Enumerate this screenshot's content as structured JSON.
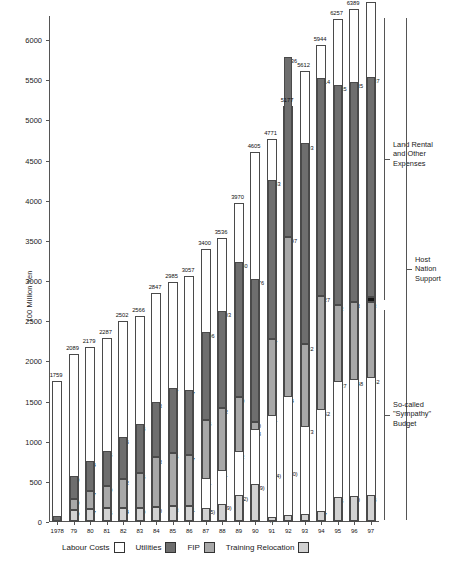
{
  "chart_data": {
    "type": "bar",
    "stacked": true,
    "title": "",
    "xlabel": "",
    "ylabel": "100 Million Yen",
    "ylim": [
      0,
      6300
    ],
    "ytick_values": [
      0,
      500,
      1000,
      1500,
      2000,
      2500,
      3000,
      3500,
      4000,
      4500,
      5000,
      5500,
      6000
    ],
    "ytick_labels": [
      "0",
      "500",
      "1000",
      "1500",
      "2000",
      "2500",
      "3000",
      "3500",
      "4000",
      "4500",
      "5000",
      "5500",
      "6000"
    ],
    "grid": false,
    "legend_position": "bottom",
    "categories": [
      "1978",
      "79",
      "80",
      "81",
      "82",
      "83",
      "84",
      "85",
      "86",
      "87",
      "88",
      "89",
      "90",
      "91",
      "92",
      "93",
      "94",
      "95",
      "96",
      "97"
    ],
    "series": [
      {
        "name": "Labour Costs",
        "color": "#ffffff",
        "values": [
          1759,
          2089,
          2179,
          2287,
          2502,
          2566,
          2847,
          2985,
          3057,
          3400,
          3536,
          3970,
          4605,
          4771,
          5177,
          5612,
          5944,
          6257,
          6389,
          6479
        ]
      },
      {
        "name": "Utilities",
        "color": "#6e6e6e",
        "values": [
          62,
          280,
          374,
          435,
          516,
          608,
          693,
          807,
          817,
          1096,
          1203,
          1680,
          1776,
          1983,
          2236,
          2503,
          2714,
          2735,
          2735,
          2737
        ]
      },
      {
        "name": "FIP",
        "color": "#a8a8a8",
        "values": [
          0,
          140,
          227,
          279,
          362,
          435,
          613,
          654,
          627,
          735,
          792,
          690,
          957,
          1736,
          1997,
          1032,
          1252,
          1427,
          1448,
          1462
        ]
      },
      {
        "name": "Training Relocation",
        "color": "#d2d2d2",
        "values": [
          0,
          140,
          147,
          156,
          164,
          159,
          180,
          193,
          191,
          165,
          209,
          322,
          459,
          47,
          81,
          93,
          127,
          305,
          310,
          318
        ]
      }
    ],
    "bar_totals": [
      1759,
      2089,
      2179,
      2287,
      2502,
      2566,
      2847,
      2985,
      3057,
      3400,
      3536,
      3970,
      4605,
      4771,
      5177,
      5612,
      5944,
      6257,
      6389,
      6479
    ],
    "bars": [
      {
        "year": "1978",
        "total": 1759,
        "segments": [
          {
            "label": "62",
            "value": 62,
            "series": "utilities"
          }
        ]
      },
      {
        "year": "79",
        "total": 2089,
        "segments": [
          {
            "label": "140",
            "value": 140,
            "series": "training"
          },
          {
            "label": "140",
            "value": 140,
            "series": "fip"
          },
          {
            "label": "280",
            "value": 280,
            "series": "utilities"
          }
        ]
      },
      {
        "year": "80",
        "total": 2179,
        "segments": [
          {
            "label": "147",
            "value": 147,
            "series": "training"
          },
          {
            "label": "227",
            "value": 227,
            "series": "fip"
          },
          {
            "label": "374",
            "value": 374,
            "series": "utilities"
          }
        ]
      },
      {
        "year": "81",
        "total": 2287,
        "segments": [
          {
            "label": "156",
            "value": 156,
            "series": "training"
          },
          {
            "label": "279",
            "value": 279,
            "series": "fip"
          },
          {
            "label": "435",
            "value": 435,
            "series": "utilities"
          }
        ]
      },
      {
        "year": "82",
        "total": 2502,
        "segments": [
          {
            "label": "164",
            "value": 164,
            "series": "training"
          },
          {
            "label": "362",
            "value": 362,
            "series": "fip"
          },
          {
            "label": "516",
            "value": 516,
            "series": "utilities"
          }
        ]
      },
      {
        "year": "83",
        "total": 2566,
        "segments": [
          {
            "label": "159",
            "value": 159,
            "series": "training"
          },
          {
            "label": "435",
            "value": 435,
            "series": "fip"
          },
          {
            "label": "608",
            "value": 608,
            "series": "utilities"
          }
        ]
      },
      {
        "year": "84",
        "total": 2847,
        "segments": [
          {
            "label": "180",
            "value": 180,
            "series": "training"
          },
          {
            "label": "613",
            "value": 613,
            "series": "fip"
          },
          {
            "label": "693",
            "value": 693,
            "series": "utilities"
          }
        ]
      },
      {
        "year": "85",
        "total": 2985,
        "segments": [
          {
            "label": "193",
            "value": 193,
            "series": "training"
          },
          {
            "label": "654",
            "value": 654,
            "series": "fip"
          },
          {
            "label": "807",
            "value": 807,
            "series": "utilities"
          }
        ]
      },
      {
        "year": "86",
        "total": 3057,
        "segments": [
          {
            "label": "191",
            "value": 191,
            "series": "training"
          },
          {
            "label": "627",
            "value": 627,
            "series": "fip"
          },
          {
            "label": "817",
            "value": 817,
            "series": "utilities"
          }
        ]
      },
      {
        "year": "87",
        "total": 3400,
        "segments": [
          {
            "label": "(165)",
            "value": 165,
            "series": "training"
          },
          {
            "label": "361",
            "value": 361,
            "series": "labour"
          },
          {
            "label": "735",
            "value": 735,
            "series": "fip"
          },
          {
            "label": "1096",
            "value": 1096,
            "series": "utilities"
          }
        ]
      },
      {
        "year": "88",
        "total": 3536,
        "segments": [
          {
            "label": "(209)",
            "value": 209,
            "series": "training"
          },
          {
            "label": "411",
            "value": 411,
            "series": "labour"
          },
          {
            "label": "792",
            "value": 792,
            "series": "fip"
          },
          {
            "label": "1203",
            "value": 1203,
            "series": "utilities"
          }
        ]
      },
      {
        "year": "89",
        "total": 3970,
        "segments": [
          {
            "label": "(322)",
            "value": 322,
            "series": "training"
          },
          {
            "label": "532",
            "value": 532,
            "series": "labour"
          },
          {
            "label": "690",
            "value": 690,
            "series": "fip"
          },
          {
            "label": "1680",
            "value": 1680,
            "series": "utilities"
          }
        ]
      },
      {
        "year": "90",
        "total": 4605,
        "segments": [
          {
            "label": "(459)",
            "value": 459,
            "series": "training"
          },
          {
            "label": "678",
            "value": 678,
            "series": "labour"
          },
          {
            "label": "100",
            "value": 100,
            "series": "fip"
          },
          {
            "label": "1776",
            "value": 1776,
            "series": "utilities"
          }
        ]
      },
      {
        "year": "91",
        "total": 4771,
        "segments": [
          {
            "label": "47",
            "value": 47,
            "series": "training"
          },
          {
            "label": "(564)",
            "value": 564,
            "series": "labour"
          },
          {
            "label": "701",
            "value": 701,
            "series": "labour"
          },
          {
            "label": "957",
            "value": 957,
            "series": "fip"
          },
          {
            "label": "1983",
            "value": 1983,
            "series": "utilities"
          }
        ]
      },
      {
        "year": "92",
        "total": 5177,
        "segments": [
          {
            "label": "81",
            "value": 81,
            "series": "training"
          },
          {
            "label": "(560)",
            "value": 560,
            "series": "labour"
          },
          {
            "label": "904",
            "value": 904,
            "series": "labour"
          },
          {
            "label": "1997",
            "value": 1997,
            "series": "fip"
          },
          {
            "label": "2236",
            "value": 2236,
            "series": "utilities"
          }
        ]
      },
      {
        "year": "93",
        "total": 5612,
        "segments": [
          {
            "label": "93",
            "value": 93,
            "series": "training"
          },
          {
            "label": "1073",
            "value": 1073,
            "series": "labour"
          },
          {
            "label": "1032",
            "value": 1032,
            "series": "fip"
          },
          {
            "label": "2503",
            "value": 2503,
            "series": "utilities"
          }
        ]
      },
      {
        "year": "94",
        "total": 5944,
        "segments": [
          {
            "label": "127",
            "value": 127,
            "series": "training"
          },
          {
            "label": "1252",
            "value": 1252,
            "series": "labour"
          },
          {
            "label": "1427",
            "value": 1427,
            "series": "fip"
          },
          {
            "label": "2714",
            "value": 2714,
            "series": "utilities"
          }
        ]
      },
      {
        "year": "95",
        "total": 6257,
        "segments": [
          {
            "label": "305",
            "value": 305,
            "series": "training"
          },
          {
            "label": "1427",
            "value": 1427,
            "series": "labour"
          },
          {
            "label": "962",
            "value": 962,
            "series": "fip"
          },
          {
            "label": "2735",
            "value": 2735,
            "series": "utilities"
          }
        ]
      },
      {
        "year": "96",
        "total": 6389,
        "segments": [
          {
            "label": "310",
            "value": 310,
            "series": "training"
          },
          {
            "label": "1448",
            "value": 1448,
            "series": "labour"
          },
          {
            "label": "973",
            "value": 973,
            "series": "fip"
          },
          {
            "label": "2735",
            "value": 2735,
            "series": "utilities"
          }
        ]
      },
      {
        "year": "97",
        "total": 6479,
        "segments": [
          {
            "label": "318",
            "value": 318,
            "series": "training"
          },
          {
            "label": "1462",
            "value": 1462,
            "series": "labour"
          },
          {
            "label": "953",
            "value": 953,
            "series": "fip"
          },
          {
            "label": "61",
            "value": 61,
            "series": "other"
          },
          {
            "label": "2737",
            "value": 2737,
            "series": "utilities"
          }
        ]
      }
    ],
    "annotations": [
      {
        "id": "land-rental",
        "text": "Land Rental\nand Other\nExpenses"
      },
      {
        "id": "host-nation-support",
        "text": "Host\nNation\nSupport"
      },
      {
        "id": "sympathy-budget",
        "text": "So-called\n\"Sympathy\"\nBudget"
      }
    ]
  },
  "legend": {
    "items": [
      {
        "label": "Labour Costs",
        "key": "labour"
      },
      {
        "label": "Utilities",
        "key": "utilities"
      },
      {
        "label": "FIP",
        "key": "fip"
      },
      {
        "label": "Training Relocation",
        "key": "training"
      }
    ]
  }
}
